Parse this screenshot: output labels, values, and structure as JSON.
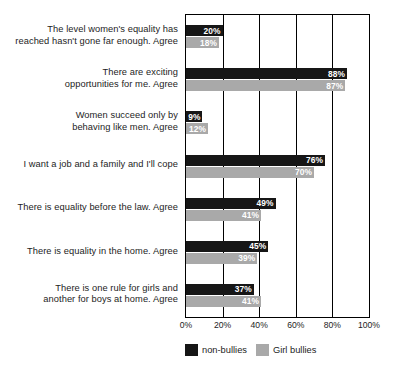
{
  "chart_data": {
    "type": "bar",
    "orientation": "horizontal",
    "title": "",
    "xlabel": "",
    "ylabel": "",
    "xlim": [
      0,
      100
    ],
    "grid": true,
    "legend_position": "bottom",
    "tick_labels": [
      "0%",
      "20%",
      "40%",
      "60%",
      "80%",
      "100%"
    ],
    "tick_values": [
      0,
      20,
      40,
      60,
      80,
      100
    ],
    "categories": [
      "The level women's equality has reached hasn't gone far enough. Agree",
      "There are exciting opportunities for me. Agree",
      "Women succeed only by behaving like men. Agree",
      "I want a job and a family and I'll cope",
      "There is equality before the law. Agree",
      "There is equality in the home. Agree",
      "There is one rule for girls and another for boys at home. Agree"
    ],
    "category_lines": [
      [
        "The level women's equality has",
        "reached hasn't gone far enough. Agree"
      ],
      [
        "There are exciting",
        "opportunities for me. Agree"
      ],
      [
        "Women succeed only by",
        "behaving like men. Agree"
      ],
      [
        "I want a job and a family and I'll cope"
      ],
      [
        "There is equality before the law. Agree"
      ],
      [
        "There is equality in the home. Agree"
      ],
      [
        "There is one rule for girls and",
        "another for boys at home. Agree"
      ]
    ],
    "series": [
      {
        "name": "non-bullies",
        "color": "#161616",
        "values": [
          20,
          88,
          9,
          76,
          49,
          45,
          37
        ],
        "labels": [
          "20%",
          "88%",
          "9%",
          "76%",
          "49%",
          "45%",
          "37%"
        ]
      },
      {
        "name": "Girl bullies",
        "color": "#a9a9a9",
        "values": [
          18,
          87,
          12,
          70,
          41,
          39,
          41
        ],
        "labels": [
          "18%",
          "87%",
          "12%",
          "70%",
          "41%",
          "39%",
          "41%"
        ]
      }
    ]
  },
  "legend": {
    "items": [
      {
        "label": "non-bullies",
        "color": "#161616"
      },
      {
        "label": "Girl bullies",
        "color": "#a9a9a9"
      }
    ]
  }
}
